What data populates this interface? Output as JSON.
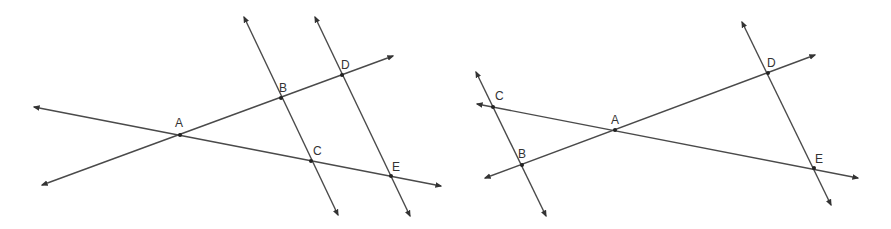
{
  "diagrams": [
    {
      "id": "left",
      "points": {
        "A": {
          "label": "A",
          "x": 180,
          "y": 135,
          "lx": 175,
          "ly": 127
        },
        "B": {
          "label": "B",
          "x": 281,
          "y": 98,
          "lx": 279,
          "ly": 92
        },
        "C": {
          "label": "C",
          "x": 311,
          "y": 161,
          "lx": 313,
          "ly": 155
        },
        "D": {
          "label": "D",
          "x": 342,
          "y": 75,
          "lx": 341,
          "ly": 69
        },
        "E": {
          "label": "E",
          "x": 391,
          "y": 176,
          "lx": 392,
          "ly": 171
        }
      },
      "lines": [
        {
          "name": "line-ad",
          "x1": 42,
          "y1": 185,
          "x2": 393,
          "y2": 56
        },
        {
          "name": "line-ae",
          "x1": 34,
          "y1": 107,
          "x2": 441,
          "y2": 186
        },
        {
          "name": "line-bc",
          "x1": 244,
          "y1": 17,
          "x2": 338,
          "y2": 215
        },
        {
          "name": "line-de",
          "x1": 315,
          "y1": 17,
          "x2": 410,
          "y2": 216
        }
      ]
    },
    {
      "id": "right",
      "points": {
        "A": {
          "label": "A",
          "x": 615,
          "y": 130,
          "lx": 611,
          "ly": 124
        },
        "B": {
          "label": "B",
          "x": 522,
          "y": 165,
          "lx": 518,
          "ly": 158
        },
        "C": {
          "label": "C",
          "x": 493,
          "y": 107,
          "lx": 495,
          "ly": 100
        },
        "D": {
          "label": "D",
          "x": 768,
          "y": 73,
          "lx": 767,
          "ly": 67
        },
        "E": {
          "label": "E",
          "x": 814,
          "y": 168,
          "lx": 815,
          "ly": 163
        }
      },
      "lines": [
        {
          "name": "line-bd",
          "x1": 485,
          "y1": 178,
          "x2": 815,
          "y2": 55
        },
        {
          "name": "line-ce",
          "x1": 477,
          "y1": 104,
          "x2": 858,
          "y2": 178
        },
        {
          "name": "line-cb",
          "x1": 476,
          "y1": 72,
          "x2": 546,
          "y2": 216
        },
        {
          "name": "line-de",
          "x1": 742,
          "y1": 22,
          "x2": 831,
          "y2": 205
        }
      ]
    }
  ],
  "colors": {
    "stroke": "#4a4a4a",
    "point": "#222222",
    "label": "#333333"
  }
}
